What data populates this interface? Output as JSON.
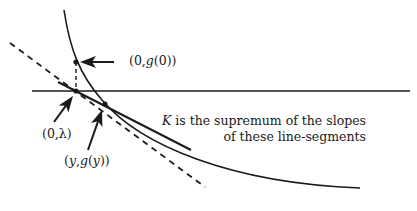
{
  "diagram": {
    "colors": {
      "stroke": "#1a1a1a",
      "background": "#ffffff"
    },
    "labels": {
      "point_g0": {
        "prefix": "(0,",
        "func": "g",
        "arg": "(0)",
        "suffix": ")"
      },
      "point_lambda": "(0,λ)",
      "point_y": {
        "prefix": "(",
        "var": "y",
        "sep": ",",
        "func": "g",
        "arg_open": "(",
        "arg_var": "y",
        "suffix": "))"
      }
    },
    "caption": {
      "line1_var": "K",
      "line1_rest": " is the supremum of the slopes",
      "line2": "of these line-segments"
    },
    "elements": {
      "x_axis": {
        "x1": 32,
        "y1": 91,
        "x2": 410,
        "y2": 91
      },
      "curve_g": "M64,10 C70,50 80,75 102,100 C140,145 230,183 360,188",
      "tangent_dashed": {
        "x1": 10,
        "y1": 43,
        "x2": 205,
        "y2": 187
      },
      "solid_segment": {
        "x1": 58,
        "y1": 82,
        "x2": 191,
        "y2": 150
      },
      "vertical_dashed": {
        "x1": 76,
        "y1": 62,
        "x2": 76,
        "y2": 91
      },
      "points": [
        {
          "name": "g0",
          "cx": 76,
          "cy": 62
        },
        {
          "name": "lambda",
          "cx": 76,
          "cy": 91
        },
        {
          "name": "y",
          "cx": 105,
          "cy": 104
        }
      ],
      "arrows": [
        {
          "name": "arrow-to-g0",
          "x1": 114,
          "y1": 62,
          "x2": 80,
          "y2": 62
        },
        {
          "name": "arrow-to-lambda",
          "x1": 54,
          "y1": 122,
          "x2": 73,
          "y2": 96
        },
        {
          "name": "arrow-to-y",
          "x1": 88,
          "y1": 150,
          "x2": 102,
          "y2": 110
        }
      ]
    }
  }
}
